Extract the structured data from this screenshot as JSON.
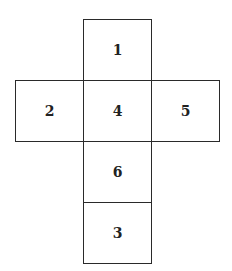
{
  "diagram": {
    "type": "cube-net",
    "faces": [
      {
        "label": "1",
        "x": 83,
        "y": 19,
        "w": 69,
        "h": 62
      },
      {
        "label": "2",
        "x": 15,
        "y": 80,
        "w": 69,
        "h": 62
      },
      {
        "label": "4",
        "x": 83,
        "y": 80,
        "w": 69,
        "h": 62
      },
      {
        "label": "5",
        "x": 151,
        "y": 80,
        "w": 69,
        "h": 62
      },
      {
        "label": "6",
        "x": 83,
        "y": 141,
        "w": 69,
        "h": 62
      },
      {
        "label": "3",
        "x": 83,
        "y": 201,
        "w": 69,
        "h": 62
      }
    ]
  }
}
